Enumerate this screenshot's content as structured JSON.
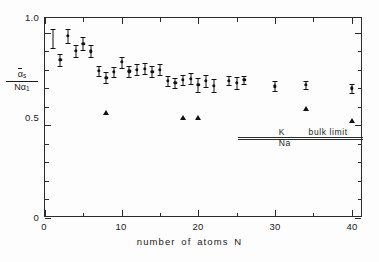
{
  "chart_data": {
    "type": "scatter",
    "title": "",
    "xlabel": "number of atoms N",
    "ylabel_numerator": "ᾱs",
    "ylabel_denominator": "Nα₁",
    "xlim": [
      0,
      41.5
    ],
    "ylim": [
      0,
      1.08
    ],
    "grid": false,
    "legend": null,
    "xticks_major": [
      0,
      10,
      20,
      30,
      40
    ],
    "xticks_minor": [
      5,
      15,
      25,
      35
    ],
    "xtick_labels": [
      "0",
      "10",
      "20",
      "30",
      "40"
    ],
    "yticks_major": [
      0,
      0.5,
      1.0
    ],
    "yticks_minor": [
      0.1,
      0.2,
      0.3,
      0.4,
      0.6,
      0.7,
      0.8,
      0.9
    ],
    "ytick_labels": [
      "0",
      "0.5",
      "1.0"
    ],
    "series": [
      {
        "name": "measured polarizability with error bars",
        "marker": "circle",
        "points": [
          {
            "x": 2,
            "y": 0.855,
            "err": 0.032
          },
          {
            "x": 3,
            "y": 0.985,
            "err": 0.038
          },
          {
            "x": 4,
            "y": 0.902,
            "err": 0.03
          },
          {
            "x": 5,
            "y": 0.942,
            "err": 0.035
          },
          {
            "x": 6,
            "y": 0.9,
            "err": 0.032
          },
          {
            "x": 7,
            "y": 0.795,
            "err": 0.028
          },
          {
            "x": 8,
            "y": 0.758,
            "err": 0.03
          },
          {
            "x": 9,
            "y": 0.79,
            "err": 0.028
          },
          {
            "x": 10,
            "y": 0.842,
            "err": 0.03
          },
          {
            "x": 11,
            "y": 0.792,
            "err": 0.03
          },
          {
            "x": 12,
            "y": 0.8,
            "err": 0.03
          },
          {
            "x": 13,
            "y": 0.806,
            "err": 0.03
          },
          {
            "x": 14,
            "y": 0.79,
            "err": 0.03
          },
          {
            "x": 15,
            "y": 0.8,
            "err": 0.03
          },
          {
            "x": 16,
            "y": 0.74,
            "err": 0.028
          },
          {
            "x": 17,
            "y": 0.73,
            "err": 0.028
          },
          {
            "x": 18,
            "y": 0.745,
            "err": 0.028
          },
          {
            "x": 19,
            "y": 0.752,
            "err": 0.03
          },
          {
            "x": 20,
            "y": 0.718,
            "err": 0.04
          },
          {
            "x": 21,
            "y": 0.74,
            "err": 0.03
          },
          {
            "x": 22,
            "y": 0.715,
            "err": 0.035
          },
          {
            "x": 24,
            "y": 0.742,
            "err": 0.026
          },
          {
            "x": 25,
            "y": 0.73,
            "err": 0.032
          },
          {
            "x": 26,
            "y": 0.745,
            "err": 0.024
          },
          {
            "x": 30,
            "y": 0.712,
            "err": 0.026
          },
          {
            "x": 34,
            "y": 0.718,
            "err": 0.024
          },
          {
            "x": 40,
            "y": 0.7,
            "err": 0.024
          }
        ]
      },
      {
        "name": "theoretical / alternate values",
        "marker": "triangle",
        "points": [
          {
            "x": 8,
            "y": 0.565
          },
          {
            "x": 18,
            "y": 0.54
          },
          {
            "x": 20,
            "y": 0.54
          },
          {
            "x": 34,
            "y": 0.588
          },
          {
            "x": 40,
            "y": 0.522
          }
        ]
      }
    ],
    "reference_errorbar": {
      "x": 1.0,
      "y": 0.968,
      "err": 0.05
    },
    "annotations": [
      {
        "text": "K",
        "x": 30.5,
        "y": 0.462
      },
      {
        "text": "Na",
        "x": 30.5,
        "y": 0.406
      },
      {
        "text": "bulk limit",
        "x": 34.4,
        "y": 0.462
      }
    ],
    "reference_lines": [
      {
        "label": "K bulk limit",
        "y": 0.44,
        "x_start": 25.2,
        "x_end": 41.5
      },
      {
        "label": "Na bulk limit",
        "y": 0.428,
        "x_start": 25.2,
        "x_end": 41.5
      }
    ]
  },
  "axis": {
    "x_title": "number of atoms N",
    "y_numerator": "α",
    "y_numerator_sub": "s",
    "y_denominator": "Nα",
    "y_denominator_sub": "1"
  },
  "labels": {
    "y0": "0",
    "y05": "0.5",
    "y10": "1.0",
    "x0": "0",
    "x10": "10",
    "x20": "20",
    "x30": "30",
    "x40": "40",
    "bulk_k": "K",
    "bulk_na": "Na",
    "bulk_text": "bulk limit"
  },
  "colors": {
    "axis": "#2b2b2b",
    "marker": "#111111",
    "background": "#fdfdfd"
  }
}
